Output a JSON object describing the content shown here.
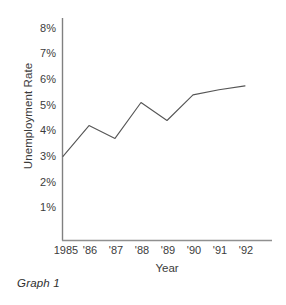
{
  "chart_data": {
    "type": "line",
    "title": "",
    "subtitle": "",
    "xlabel": "Year",
    "ylabel": "Unemployment Rate",
    "categories": [
      "1985",
      "'86",
      "'87",
      "'88",
      "'89",
      "'90",
      "'91",
      "'92"
    ],
    "x": [
      1985,
      1986,
      1987,
      1988,
      1989,
      1990,
      1991,
      1992
    ],
    "values": [
      3.0,
      4.2,
      3.7,
      5.1,
      4.4,
      5.4,
      5.6,
      5.75
    ],
    "series": [
      {
        "name": "Unemployment Rate",
        "values": [
          3.0,
          4.2,
          3.7,
          5.1,
          4.4,
          5.4,
          5.6,
          5.75
        ]
      }
    ],
    "y_tick_labels": [
      "8%",
      "7%",
      "6%",
      "5%",
      "4%",
      "3%",
      "2%",
      "1%"
    ],
    "y_tick_values": [
      8,
      7,
      6,
      5,
      4,
      3,
      2,
      1
    ],
    "ylim": [
      0,
      8.7
    ],
    "xlim": [
      1984.6,
      1992.6
    ],
    "grid": false,
    "legend": false,
    "legend_position": "none",
    "line_color": "#555555",
    "axis_color": "#7a7a7a",
    "background_color": "#ffffff",
    "annotations": []
  },
  "caption": {
    "text": "Graph 1"
  }
}
